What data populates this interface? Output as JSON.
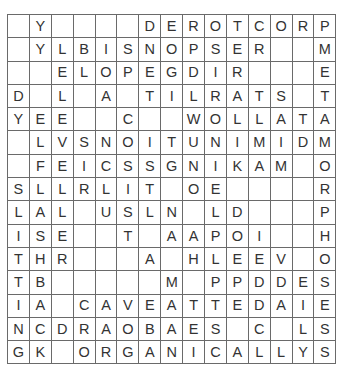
{
  "puzzle": {
    "type": "word-search",
    "rows": 15,
    "cols": 15,
    "grid": [
      [
        "",
        "Y",
        "",
        "",
        "",
        "",
        "D",
        "E",
        "R",
        "O",
        "T",
        "C",
        "O",
        "R",
        "P"
      ],
      [
        "",
        "Y",
        "L",
        "B",
        "I",
        "S",
        "N",
        "O",
        "P",
        "S",
        "E",
        "R",
        "",
        "",
        "M"
      ],
      [
        "",
        "",
        "E",
        "L",
        "O",
        "P",
        "E",
        "G",
        "D",
        "I",
        "R",
        "",
        "",
        "",
        "E"
      ],
      [
        "D",
        "",
        "L",
        "",
        "A",
        "",
        "T",
        "I",
        "L",
        "R",
        "A",
        "T",
        "S",
        "",
        "T"
      ],
      [
        "Y",
        "E",
        "E",
        "",
        "",
        "C",
        "",
        "",
        "W",
        "O",
        "L",
        "L",
        "A",
        "T",
        "A"
      ],
      [
        "",
        "L",
        "V",
        "S",
        "N",
        "O",
        "I",
        "T",
        "U",
        "N",
        "I",
        "M",
        "I",
        "D",
        "M"
      ],
      [
        "",
        "F",
        "E",
        "I",
        "C",
        "S",
        "S",
        "G",
        "N",
        "I",
        "K",
        "A",
        "M",
        "",
        "O"
      ],
      [
        "S",
        "L",
        "L",
        "R",
        "L",
        "I",
        "T",
        "",
        "O",
        "E",
        "",
        "",
        "",
        "",
        "R"
      ],
      [
        "L",
        "A",
        "L",
        "",
        "U",
        "S",
        "L",
        "N",
        "",
        "L",
        "D",
        "",
        "",
        "",
        "P"
      ],
      [
        "I",
        "S",
        "E",
        "",
        "",
        "T",
        "",
        "A",
        "A",
        "P",
        "O",
        "I",
        "",
        "",
        "H"
      ],
      [
        "T",
        "H",
        "R",
        "",
        "",
        "",
        "A",
        "",
        "H",
        "L",
        "E",
        "E",
        "V",
        "",
        "O"
      ],
      [
        "T",
        "B",
        "",
        "",
        "",
        "",
        "",
        "M",
        "",
        "P",
        "P",
        "D",
        "D",
        "E",
        "S"
      ],
      [
        "I",
        "A",
        "",
        "C",
        "A",
        "V",
        "E",
        "A",
        "T",
        "T",
        "E",
        "D",
        "A",
        "I",
        "E"
      ],
      [
        "N",
        "C",
        "D",
        "R",
        "A",
        "O",
        "B",
        "A",
        "E",
        "S",
        "",
        "C",
        "",
        "L",
        "S"
      ],
      [
        "G",
        "K",
        "",
        "O",
        "R",
        "G",
        "A",
        "N",
        "I",
        "C",
        "A",
        "L",
        "L",
        "Y",
        "S"
      ]
    ]
  },
  "colors": {
    "grid_line": "#6a6a6a",
    "letter": "#333333",
    "background": "#ffffff"
  }
}
